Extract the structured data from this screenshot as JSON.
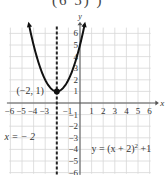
{
  "header": {
    "cut_text": "(6  5)       )"
  },
  "chart_data": {
    "type": "line",
    "title": "",
    "function_label": "y = (x + 2)^2 + 1",
    "function_label_text": "y = (x + 2)",
    "function_label_exp": "2",
    "function_label_tail": " +1",
    "vertex": {
      "x": -2,
      "y": 1,
      "label": "(−2, 1)"
    },
    "axis_of_symmetry": {
      "x": -2,
      "label": "x = − 2",
      "style": "dashed"
    },
    "xlabel": "x",
    "ylabel": "y",
    "xlim": [
      -6.5,
      6.5
    ],
    "ylim": [
      -6,
      6.5
    ],
    "x_ticks": [
      -6,
      -5,
      -4,
      -3,
      -2,
      -1,
      1,
      2,
      3,
      4,
      5,
      6
    ],
    "x_tick_labels": [
      "−6",
      "−5",
      "−4",
      "−3",
      "",
      "−1",
      "1",
      "2",
      "3",
      "4",
      "5",
      "6"
    ],
    "y_ticks": [
      -6,
      -5,
      -4,
      -3,
      -2,
      -1,
      1,
      2,
      3,
      4,
      5,
      6
    ],
    "y_tick_labels": [
      "−6",
      "−5",
      "−4",
      "−3",
      "−2",
      "−1",
      "1",
      "2",
      "3",
      "4",
      "5",
      "6"
    ],
    "grid": true,
    "series": [
      {
        "name": "parabola",
        "x": [
          -4.4,
          -4,
          -3,
          -2,
          -1,
          0,
          0.4
        ],
        "y": [
          6.76,
          5,
          2,
          1,
          2,
          5,
          6.76
        ]
      }
    ]
  }
}
